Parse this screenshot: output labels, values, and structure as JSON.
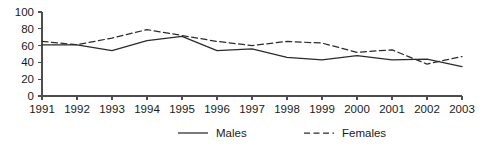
{
  "chart_data": {
    "type": "line",
    "title": "",
    "subtitle": "",
    "xlabel": "",
    "ylabel": "",
    "categories": [
      "1991",
      "1992",
      "1993",
      "1994",
      "1995",
      "1996",
      "1997",
      "1998",
      "1999",
      "2000",
      "2001",
      "2002",
      "2003"
    ],
    "series": [
      {
        "name": "Males",
        "style": "solid",
        "color": "#2b2b2b",
        "values": [
          61,
          61,
          54,
          66,
          71,
          54,
          56,
          46,
          43,
          48,
          43,
          44,
          35
        ]
      },
      {
        "name": "Females",
        "style": "dashed",
        "color": "#2b2b2b",
        "values": [
          65,
          61,
          69,
          79,
          72,
          65,
          60,
          65,
          63,
          52,
          55,
          38,
          47
        ]
      }
    ],
    "ylim": [
      0,
      100
    ],
    "yticks": [
      0,
      20,
      40,
      60,
      80,
      100
    ],
    "ytick_labels": [
      "0",
      "20",
      "40",
      "60",
      "80",
      "100"
    ],
    "xtick_labels": [
      "1991",
      "1992",
      "1993",
      "1994",
      "1995",
      "1996",
      "1997",
      "1998",
      "1999",
      "2000",
      "2001",
      "2002",
      "2003"
    ],
    "grid": false,
    "legend_position": "bottom-center",
    "legend_entries": [
      {
        "label": "Males",
        "style": "solid"
      },
      {
        "label": "Females",
        "style": "dashed"
      }
    ]
  },
  "legend": {
    "males_label": "Males",
    "females_label": "Females"
  },
  "colors": {
    "axis": "#4d4d4d",
    "line": "#2b2b2b",
    "text": "#1a1a1a",
    "background": "#ffffff"
  }
}
